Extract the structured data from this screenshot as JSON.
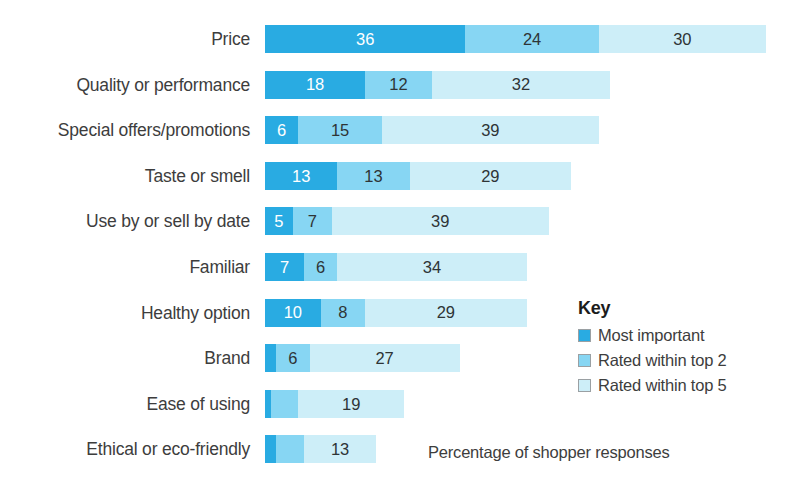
{
  "chart_data": {
    "type": "bar",
    "title": "",
    "subtitle": "",
    "xlabel": "Percentage of shopper responses",
    "ylabel": "",
    "orientation": "horizontal",
    "stacked": true,
    "grid": false,
    "xlim": [
      0,
      92
    ],
    "legend_position": "right",
    "categories": [
      "Price",
      "Quality or performance",
      "Special offers/promotions",
      "Taste or smell",
      "Use by or sell by date",
      "Familiar",
      "Healthy option",
      "Brand",
      "Ease of using",
      "Ethical or eco-friendly"
    ],
    "series": [
      {
        "name": "Most important",
        "color": "#29ABE2",
        "values": [
          36,
          18,
          6,
          13,
          5,
          7,
          10,
          2,
          1,
          2
        ],
        "labels": [
          "36",
          "18",
          "6",
          "13",
          "5",
          "7",
          "10",
          "",
          "",
          ""
        ]
      },
      {
        "name": "Rated within top 2",
        "color": "#87D6F3",
        "values": [
          24,
          12,
          15,
          13,
          7,
          6,
          8,
          6,
          5,
          5
        ],
        "labels": [
          "24",
          "12",
          "15",
          "13",
          "7",
          "6",
          "8",
          "6",
          "",
          ""
        ]
      },
      {
        "name": "Rated within top 5",
        "color": "#CDEEF8",
        "values": [
          30,
          32,
          39,
          29,
          39,
          34,
          29,
          27,
          19,
          13
        ],
        "labels": [
          "30",
          "32",
          "39",
          "29",
          "39",
          "34",
          "29",
          "27",
          "19",
          "13"
        ]
      }
    ]
  },
  "legend": {
    "title": "Key",
    "items": [
      {
        "label": "Most important",
        "color": "#29ABE2"
      },
      {
        "label": "Rated within top 2",
        "color": "#87D6F3"
      },
      {
        "label": "Rated within top 5",
        "color": "#CDEEF8"
      }
    ]
  },
  "axis_caption": "Percentage of shopper responses",
  "layout": {
    "bar_left_px": 265,
    "row_top_px": 24,
    "row_pitch_px": 45.6,
    "bar_height_px": 28,
    "px_per_unit": 5.565
  }
}
